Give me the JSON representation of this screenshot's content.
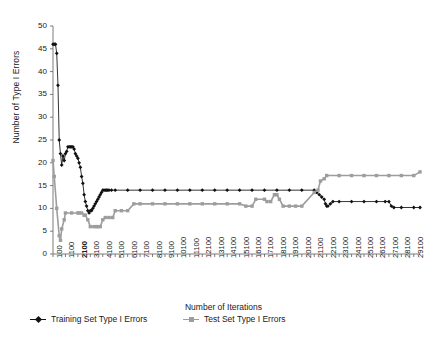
{
  "chart_data": {
    "type": "line",
    "title": "",
    "xlabel": "Number of Iterations",
    "ylabel": "Number of Type I Errors",
    "xlim": [
      100,
      29600
    ],
    "ylim": [
      0,
      50
    ],
    "ytick_step": 5,
    "grid": false,
    "legend_position": "bottom",
    "yticks": [
      0,
      5,
      10,
      15,
      20,
      25,
      30,
      35,
      40,
      45,
      50
    ],
    "ytick_labels": [
      "0",
      "5",
      "10",
      "15",
      "20",
      "25",
      "30",
      "35",
      "40",
      "45",
      "50"
    ],
    "xticks": [
      100,
      1100,
      2100,
      3100,
      4100,
      5100,
      6100,
      7100,
      8100,
      9100,
      10100,
      11100,
      12100,
      13100,
      14100,
      15100,
      16100,
      17100,
      18100,
      19100,
      20100,
      21100,
      22100,
      23100,
      24100,
      25100,
      26100,
      27100,
      28100,
      29100
    ],
    "xtick_labels": [
      "100",
      "1100",
      "2100",
      "3100",
      "4100",
      "5100",
      "6100",
      "7100",
      "8100",
      "9100",
      "10100",
      "11100",
      "12100",
      "13100",
      "14100",
      "15100",
      "16100",
      "17100",
      "18100",
      "19100",
      "20100",
      "21100",
      "22100",
      "23100",
      "24100",
      "25100",
      "26100",
      "27100",
      "28100",
      "29100"
    ],
    "series": [
      {
        "name": "Training Set Type I Errors",
        "color": "#111111",
        "marker": "diamond",
        "x": [
          100,
          200,
          300,
          400,
          500,
          600,
          700,
          800,
          900,
          1000,
          1100,
          1200,
          1300,
          1400,
          1500,
          1600,
          1700,
          1800,
          1900,
          2000,
          2100,
          2200,
          2300,
          2400,
          2500,
          2600,
          2700,
          2800,
          2900,
          3000,
          3100,
          3200,
          3300,
          3400,
          3500,
          3600,
          3700,
          3800,
          3900,
          4000,
          4100,
          4200,
          4300,
          4400,
          4500,
          4600,
          4800,
          5100,
          6100,
          7100,
          8100,
          9100,
          10100,
          11100,
          12100,
          13100,
          14100,
          15100,
          16100,
          17100,
          18100,
          19100,
          20100,
          21100,
          21300,
          21500,
          21700,
          21900,
          22000,
          22100,
          22200,
          22400,
          22600,
          23100,
          24100,
          25100,
          26100,
          26800,
          27100,
          27300,
          27500,
          28100,
          29100,
          29600
        ],
        "y": [
          46,
          46,
          46,
          44,
          37,
          25,
          22,
          19.5,
          21.5,
          20.5,
          22,
          22.5,
          23.5,
          23.5,
          23.5,
          23.5,
          23.5,
          23,
          22,
          21.5,
          21,
          20,
          19,
          17,
          15.5,
          13,
          11.5,
          10.5,
          9.5,
          9,
          9.5,
          9.5,
          10,
          10.5,
          11,
          11.5,
          12,
          12.5,
          13,
          13.5,
          14,
          14,
          14,
          14,
          14,
          14,
          14,
          14,
          14,
          14,
          14,
          14,
          14,
          14,
          14,
          14,
          14,
          14,
          14,
          14,
          14,
          14,
          14,
          14,
          13.5,
          13,
          12.5,
          12,
          11,
          10.5,
          10.5,
          11,
          11.5,
          11.5,
          11.5,
          11.5,
          11.5,
          11.5,
          11.5,
          10.5,
          10.2,
          10.2,
          10.2,
          10.2
        ]
      },
      {
        "name": "Test Set Type I Errors",
        "color": "#9d9d9d",
        "marker": "square",
        "x": [
          100,
          200,
          400,
          600,
          700,
          800,
          1000,
          1100,
          1600,
          2100,
          2200,
          2400,
          2600,
          2700,
          2900,
          3100,
          3400,
          3600,
          3700,
          3900,
          4100,
          4300,
          4600,
          4900,
          5100,
          5600,
          6100,
          6600,
          7100,
          8100,
          9100,
          10100,
          11100,
          12100,
          13100,
          14100,
          15100,
          15600,
          16100,
          16400,
          17100,
          17300,
          17600,
          17900,
          18100,
          18300,
          18600,
          19100,
          19600,
          20100,
          21100,
          21400,
          21600,
          21900,
          22100,
          23100,
          24100,
          25100,
          26100,
          27100,
          28100,
          29100,
          29600
        ],
        "y": [
          20.5,
          17,
          10,
          4,
          3,
          5.5,
          7.5,
          9,
          9,
          9,
          9,
          9,
          8.5,
          8.5,
          7.5,
          6,
          6,
          6,
          6,
          6,
          7.5,
          8,
          8,
          8,
          9.5,
          9.5,
          9.5,
          11,
          11,
          11,
          11,
          11,
          11,
          11,
          11,
          11,
          11,
          10.5,
          10.5,
          12,
          12,
          11.5,
          11.5,
          13,
          13,
          12,
          10.5,
          10.5,
          10.5,
          10.5,
          13.5,
          14,
          16,
          16.5,
          17.2,
          17.2,
          17.2,
          17.2,
          17.2,
          17.2,
          17.2,
          17.2,
          18
        ]
      }
    ]
  },
  "axes": {
    "y_title": "Number of Type I Errors",
    "x_title": "Number of Iterations"
  },
  "legend": {
    "items": [
      {
        "label": "Training Set Type I Errors",
        "color": "#111111",
        "marker": "diamond"
      },
      {
        "label": "Test Set Type I Errors",
        "color": "#9d9d9d",
        "marker": "square"
      }
    ]
  },
  "colors": {
    "training": "#111111",
    "test": "#9d9d9d",
    "axis": "#6e6e6e",
    "text": "#1a1a1a",
    "background": "#ffffff"
  }
}
